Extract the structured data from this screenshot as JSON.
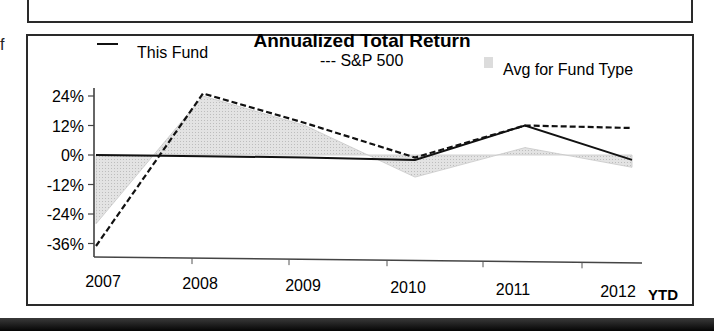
{
  "page": {
    "side_letter": "f"
  },
  "chart_data": {
    "type": "line",
    "title": "Annualized Total Return",
    "xlabel": "",
    "ylabel": "",
    "categories": [
      "2007",
      "2008",
      "2009",
      "2010",
      "2011",
      "2012"
    ],
    "x_suffix_label": "YTD",
    "y_ticks": [
      "24%",
      "12%",
      "0%",
      "-12%",
      "-24%",
      "-36%"
    ],
    "y_tick_values": [
      24,
      12,
      0,
      -12,
      -24,
      -36
    ],
    "ylim": [
      -38,
      28
    ],
    "grid": false,
    "legend_position": "top",
    "series": [
      {
        "name": "This Fund",
        "style": "solid",
        "legend_label": "— This Fund",
        "values": [
          0,
          -0.5,
          -1,
          -2,
          12,
          -2
        ],
        "color": "#111111"
      },
      {
        "name": "S&P 500",
        "style": "dashed",
        "legend_label": "--- S&P 500",
        "values": [
          -37,
          25,
          13,
          -1,
          12,
          11
        ],
        "color": "#111111"
      },
      {
        "name": "Avg for Fund Type",
        "style": "area",
        "legend_label": "Avg for Fund Type",
        "values": [
          -28,
          24,
          12,
          -9,
          3,
          -5
        ],
        "color": "#d4d4d4"
      }
    ]
  }
}
